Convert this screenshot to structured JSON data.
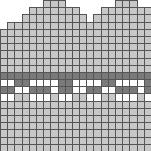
{
  "chart_data": {
    "type": "heatmap",
    "title": "",
    "grid_cols": 21,
    "grid_rows": 21,
    "cell_px": 7.19,
    "legend": {
      "0": "empty (white, no border)",
      "1": "light gray stitch",
      "2": "dark gray stitch",
      "3": "white stitch"
    },
    "colors": {
      "1": "#c8c8c8",
      "2": "#7a7a7a",
      "3": "#ffffff",
      "grid": "#555555"
    },
    "rows": [
      "000000111000000011100",
      "000011111110001111111",
      "000111111111011111111",
      "011111111111111111111",
      "111111111111111111111",
      "111111111111111111111",
      "111111111111111111111",
      "111111111111111111111",
      "111111111111111111111",
      "111111111111111111111",
      "222222222222222222222",
      "332233332233332233332",
      "223322232233223322232",
      "331133313311331133313",
      "111111111111111111111",
      "111111111111111111111",
      "111111111111111111111",
      "111111111111111111111",
      "111111111111111111111",
      "111111111111111111111",
      "111111111111111111111"
    ]
  }
}
